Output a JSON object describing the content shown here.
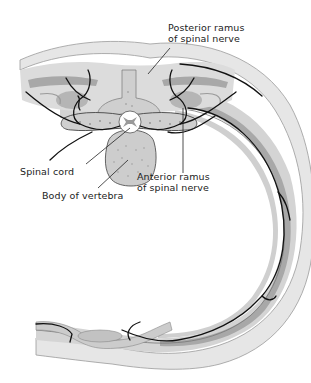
{
  "figure": {
    "type": "anatomical cross-section",
    "colors": {
      "background": "#ffffff",
      "tissue_light": "#e4e4e4",
      "tissue_mid": "#bdbdbd",
      "tissue_dark": "#9a9a9a",
      "bone": "#cfcfcf",
      "nerve": "#111111",
      "cord": "#ffffff"
    }
  },
  "labels": {
    "posterior_ramus": {
      "line1": "Posterior ramus",
      "line2": "of spinal nerve"
    },
    "spinal_cord": "Spinal cord",
    "body_of_vertebra": "Body of vertebra",
    "anterior_ramus": {
      "line1": "Anterior ramus",
      "line2": "of spinal nerve"
    }
  }
}
